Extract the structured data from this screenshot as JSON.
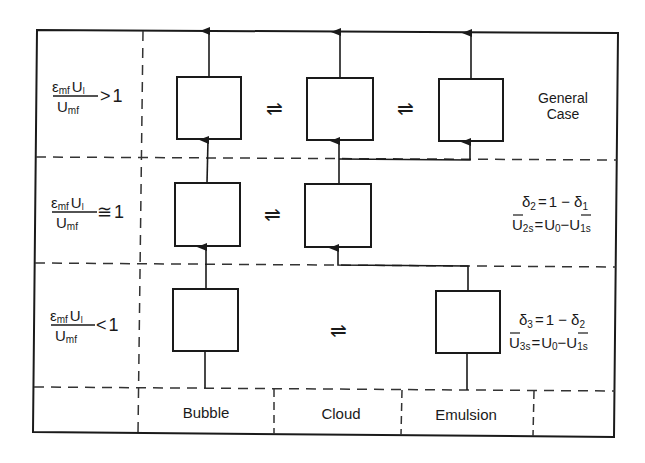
{
  "diagram": {
    "columns": [
      {
        "id": "bubble",
        "label": "Bubble"
      },
      {
        "id": "cloud",
        "label": "Cloud"
      },
      {
        "id": "emulsion",
        "label": "Emulsion"
      }
    ],
    "rows": [
      {
        "id": "row-1",
        "condition": {
          "numerator_main": "ε",
          "numerator_sub": "mf",
          "numerator_var": "U",
          "numerator_var_sub": "l",
          "denominator_main": "U",
          "denominator_sub": "mf",
          "relation": ">",
          "rhs": "1"
        },
        "boxes": [
          "bubble",
          "cloud",
          "emulsion"
        ],
        "exchange_symbols": [
          "⇌",
          "⇌"
        ],
        "note_lines": [
          "General",
          "Case"
        ]
      },
      {
        "id": "row-2",
        "condition": {
          "numerator_main": "ε",
          "numerator_sub": "mf",
          "numerator_var": "U",
          "numerator_var_sub": "l",
          "denominator_main": "U",
          "denominator_sub": "mf",
          "relation": "≅",
          "rhs": "1"
        },
        "boxes": [
          "bubble",
          "cloud"
        ],
        "exchange_symbols": [
          "⇌"
        ],
        "equations": [
          {
            "lhs": "δ",
            "lhs_sub": "2",
            "eq": "=",
            "rhs": "1 − δ",
            "rhs_sub": "1"
          },
          {
            "lhs": "U",
            "lhs_sub": "2s",
            "lhs_bar": true,
            "eq": "=",
            "rhs_a": "U",
            "rhs_a_sub": "0",
            "minus": "−",
            "rhs_b": "U",
            "rhs_b_sub": "1s",
            "rhs_b_bar": true
          }
        ]
      },
      {
        "id": "row-3",
        "condition": {
          "numerator_main": "ε",
          "numerator_sub": "mf",
          "numerator_var": "U",
          "numerator_var_sub": "l",
          "denominator_main": "U",
          "denominator_sub": "mf",
          "relation": "<",
          "rhs": "1"
        },
        "boxes": [
          "bubble",
          "emulsion"
        ],
        "exchange_symbols": [
          "⇌"
        ],
        "equations": [
          {
            "lhs": "δ",
            "lhs_sub": "3",
            "eq": "=",
            "rhs": "1 − δ",
            "rhs_sub": "2"
          },
          {
            "lhs": "U",
            "lhs_sub": "3s",
            "lhs_bar": true,
            "eq": "=",
            "rhs_a": "U",
            "rhs_a_sub": "0",
            "minus": "−",
            "rhs_b": "U",
            "rhs_b_sub": "1s",
            "rhs_b_bar": true
          }
        ]
      }
    ],
    "colors": {
      "ink": "#1a1a1a",
      "dash": "#333333",
      "background": "#ffffff"
    }
  }
}
